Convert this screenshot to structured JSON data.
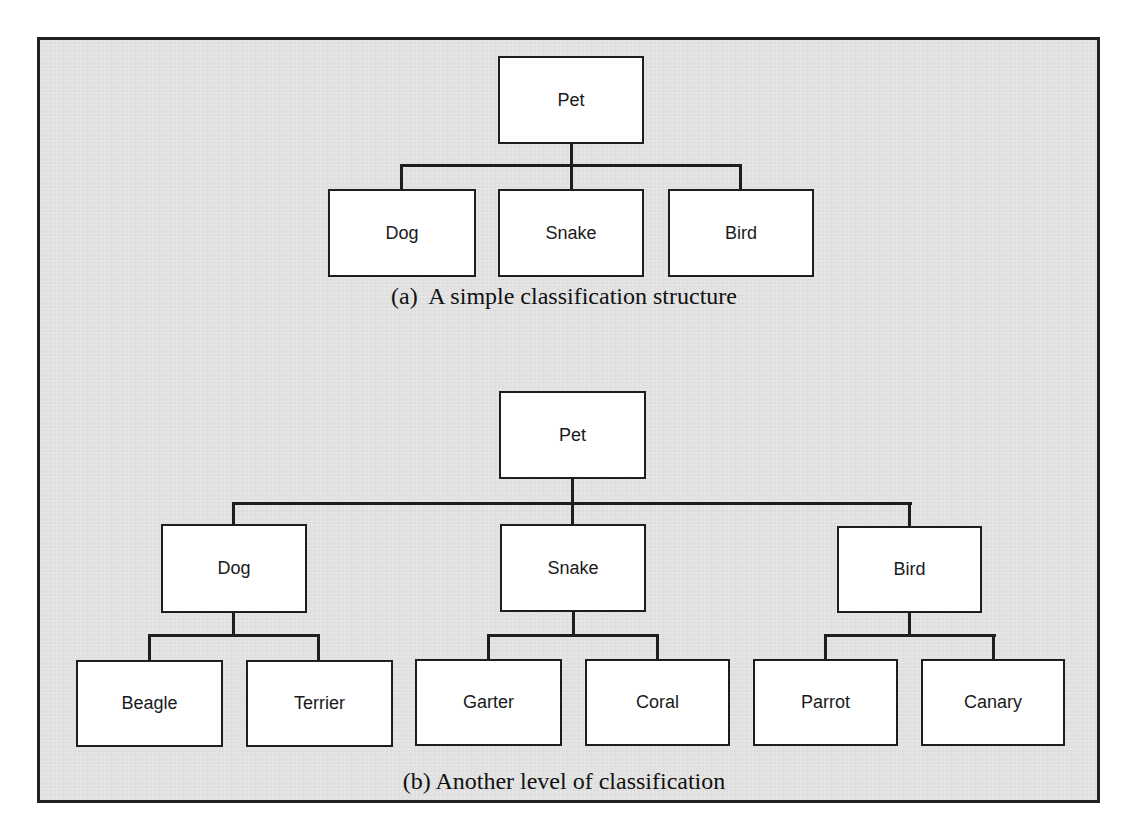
{
  "diagram_a": {
    "caption": "(a)  A simple classification structure",
    "root": "Pet",
    "children": [
      "Dog",
      "Snake",
      "Bird"
    ]
  },
  "diagram_b": {
    "caption": "(b) Another level of classification",
    "root": "Pet",
    "children": [
      {
        "label": "Dog",
        "children": [
          "Beagle",
          "Terrier"
        ]
      },
      {
        "label": "Snake",
        "children": [
          "Garter",
          "Coral"
        ]
      },
      {
        "label": "Bird",
        "children": [
          "Parrot",
          "Canary"
        ]
      }
    ]
  },
  "colors": {
    "frame_background": "#e2e2e2",
    "node_background": "#ffffff",
    "line": "#1e1e1e"
  }
}
